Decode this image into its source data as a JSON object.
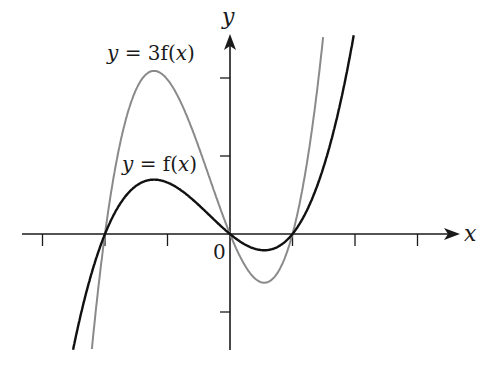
{
  "chart_data": {
    "type": "line",
    "title": "",
    "xlabel": "x",
    "ylabel": "y",
    "origin_label": "0",
    "grid": false,
    "legend": "inline curve labels",
    "xlim": [
      -3.6,
      3.4
    ],
    "ylim": [
      -1.5,
      2.6
    ],
    "x_ticks": [
      -3,
      -2,
      -1,
      0,
      1,
      2,
      3
    ],
    "y_ticks": [
      -1,
      0,
      1,
      2
    ],
    "series": [
      {
        "name": "y = f(x)",
        "label_prefix": "y",
        "label_rest": " = f(",
        "label_var": "x",
        "label_close": ")",
        "color": "#111111",
        "formula": "0.33*x*(x+2)*(x-1)",
        "roots": [
          -2,
          0,
          1
        ],
        "local_max": {
          "x": -1.22,
          "y": 0.7
        },
        "local_min": {
          "x": 0.55,
          "y": -0.21
        }
      },
      {
        "name": "y = 3f(x)",
        "label_prefix": "y",
        "label_rest": " = 3f(",
        "label_var": "x",
        "label_close": ")",
        "color": "#8a8a8a",
        "formula": "0.99*x*(x+2)*(x-1)",
        "roots": [
          -2,
          0,
          1
        ],
        "local_max": {
          "x": -1.22,
          "y": 2.09
        },
        "local_min": {
          "x": 0.55,
          "y": -0.62
        }
      }
    ]
  }
}
